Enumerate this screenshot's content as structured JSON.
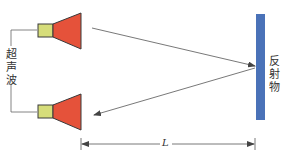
{
  "diagram": {
    "type": "ultrasonic-ranging-schematic",
    "labels": {
      "ultrasonic": "超声波",
      "reflector": "反射物",
      "distance": "L"
    },
    "colors": {
      "transducer_body": "#d6dd7a",
      "transducer_horn": "#e5523a",
      "reflector": "#4a72b8",
      "line": "#555555",
      "text": "#333333"
    },
    "nodes": [
      {
        "id": "transmitter",
        "kind": "transducer",
        "position": "top-left"
      },
      {
        "id": "receiver",
        "kind": "transducer",
        "position": "bottom-left"
      },
      {
        "id": "reflector",
        "kind": "reflector-plate",
        "position": "right"
      }
    ],
    "edges": [
      {
        "from": "transmitter",
        "to": "reflector",
        "label": "incident wave"
      },
      {
        "from": "reflector",
        "to": "receiver",
        "label": "reflected wave"
      }
    ],
    "dimension": {
      "from": "transducer-face",
      "to": "reflector",
      "label": "L"
    }
  }
}
